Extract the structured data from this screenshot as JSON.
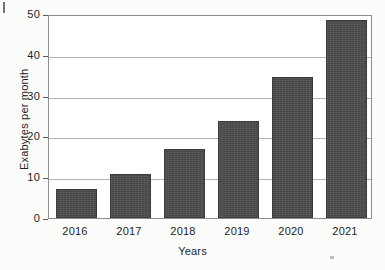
{
  "chart_data": {
    "type": "bar",
    "title": "",
    "subtitle": "",
    "xlabel": "Years",
    "ylabel": "Exabytes per month",
    "categories": [
      "2016",
      "2017",
      "2018",
      "2019",
      "2020",
      "2021"
    ],
    "values": [
      7,
      10.8,
      16.9,
      23.7,
      34.6,
      48.5
    ],
    "ylim": [
      0,
      50
    ],
    "yticks": [
      0,
      10,
      20,
      30,
      40,
      50
    ],
    "ytick_labels": [
      "0",
      "10",
      "20",
      "30",
      "40",
      "50"
    ],
    "grid": "horizontal",
    "legend": "none",
    "series": [
      {
        "name": "Mobile data traffic",
        "values": [
          7,
          10.8,
          16.9,
          23.7,
          34.6,
          48.5
        ]
      }
    ],
    "annotations": []
  },
  "style": {
    "bar_color": "#4d4d4d",
    "bar_edge_color": "#3b3b3b",
    "grid_color": "#b4b4b4",
    "axis_color": "#8d8d8d",
    "text_color": "#1d1d1d",
    "background": "#ffffff"
  },
  "artifacts": {
    "top_left_mark": "scan-mark",
    "bottom_right_mark": "scan-mark"
  }
}
